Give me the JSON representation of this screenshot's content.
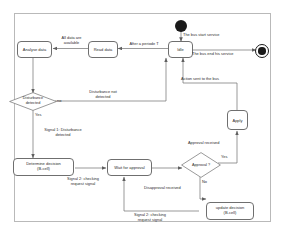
{
  "diagram": {
    "type": "uml-activity-diagram",
    "frame": {
      "label": ""
    },
    "nodes": [
      {
        "id": "start",
        "kind": "initial-node",
        "label": ""
      },
      {
        "id": "final",
        "kind": "final-node",
        "label": ""
      },
      {
        "id": "idle",
        "kind": "action",
        "label": "Idle"
      },
      {
        "id": "read_data",
        "kind": "action",
        "label": "Read data"
      },
      {
        "id": "analyse_data",
        "kind": "action",
        "label": "Analyse data"
      },
      {
        "id": "disturbance_detected",
        "kind": "decision",
        "label": "Disturbance\ndetected"
      },
      {
        "id": "determine_decision",
        "kind": "action",
        "label": "Determine decision\n(B-cell)"
      },
      {
        "id": "wait_for_approval",
        "kind": "action",
        "label": "Wait for approval"
      },
      {
        "id": "approval_q",
        "kind": "decision",
        "label": "Approval ?"
      },
      {
        "id": "update_decision",
        "kind": "action",
        "label": "update decision\n(B-cell)"
      },
      {
        "id": "apply",
        "kind": "action",
        "label": "Apply"
      }
    ],
    "edges": [
      {
        "id": "e_start_idle",
        "from": "start",
        "to": "idle",
        "label": "The bus start  service"
      },
      {
        "id": "e_idle_final",
        "from": "idle",
        "to": "final",
        "label": "The bus end his  service"
      },
      {
        "id": "e_idle_read",
        "from": "idle",
        "to": "read_data",
        "label": "After a periode T"
      },
      {
        "id": "e_read_analyse",
        "from": "read_data",
        "to": "analyse_data",
        "label": "All data are\navailable"
      },
      {
        "id": "e_analyse_dist",
        "from": "analyse_data",
        "to": "disturbance_detected",
        "label": ""
      },
      {
        "id": "e_dist_no",
        "from": "disturbance_detected",
        "to": "idle",
        "label": "no",
        "label2": "Disturbance not\ndetected"
      },
      {
        "id": "e_dist_yes",
        "from": "disturbance_detected",
        "to": "determine_decision",
        "label": "Yes",
        "label2": "Signal 1: Disturbance\ndetected"
      },
      {
        "id": "e_determine_wait",
        "from": "determine_decision",
        "to": "wait_for_approval",
        "label": "Signal 2: checking\nrequest signal"
      },
      {
        "id": "e_wait_approval",
        "from": "wait_for_approval",
        "to": "approval_q",
        "label": ""
      },
      {
        "id": "e_approval_yes",
        "from": "approval_q",
        "to": "apply",
        "label": "Yes",
        "label2": "Approval received"
      },
      {
        "id": "e_approval_no",
        "from": "approval_q",
        "to": "update_decision",
        "label": "No",
        "label2": "Disapproval received"
      },
      {
        "id": "e_update_wait",
        "from": "update_decision",
        "to": "wait_for_approval",
        "label": "Signal 2: checking\nrequest signal"
      },
      {
        "id": "e_apply_idle",
        "from": "apply",
        "to": "idle",
        "label": "Action sent to the bus"
      }
    ],
    "colors": {
      "frame_border": "#b9b9b9",
      "node_border": "#6f6f6f",
      "node_fill": "#ffffff",
      "line": "#6f6f6f",
      "text": "#2b2b2b",
      "node_dark": "#1a1a1a"
    }
  }
}
